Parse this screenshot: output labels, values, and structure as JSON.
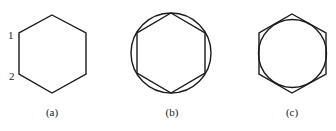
{
  "figures": [
    {
      "id": "a",
      "caption": "(a)",
      "vertex_labels": [
        "1",
        "2"
      ],
      "description": "regular hexagon"
    },
    {
      "id": "b",
      "caption": "(b)",
      "description": "hexagon inscribed in a circle"
    },
    {
      "id": "c",
      "caption": "(c)",
      "description": "circle inscribed in a hexagon"
    }
  ],
  "colors": {
    "stroke": "#1a1a1a",
    "background": "#ffffff"
  }
}
